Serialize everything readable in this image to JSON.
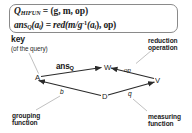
{
  "formula": {
    "line1": {
      "lhs_main": "Q",
      "lhs_sub": "HIFUN",
      "eq": "=",
      "rhs": "(g, m, op)"
    },
    "line2": {
      "fn": "ans",
      "fn_sub": "Q",
      "arg": "(a",
      "arg_sub": "i",
      "arg_close": ")",
      "eq": "=",
      "rhs_head": "red(m/g",
      "rhs_exp": "-1",
      "rhs_tail": "(a",
      "rhs_tail_sub": "i",
      "rhs_end": "), op)"
    },
    "full_text_line1": "Q_HIFUN = (g, m, op)",
    "full_text_line2": "ans_Q(a_i) = red(m/g^-1(a_i), op)"
  },
  "annotations": {
    "key": {
      "title": "key",
      "subtitle": "(of the query)"
    },
    "reduction": {
      "line1": "reduction",
      "line2": "operation"
    },
    "grouping": {
      "line1": "grouping",
      "line2": "function"
    },
    "measuring": {
      "line1": "measuring",
      "line2": "function"
    }
  },
  "diagram": {
    "nodes": [
      {
        "id": "A",
        "label": "A"
      },
      {
        "id": "W",
        "label": "W"
      },
      {
        "id": "V",
        "label": "V"
      },
      {
        "id": "D",
        "label": "D"
      }
    ],
    "edges": [
      {
        "id": "A-W",
        "from": "A",
        "to": "W",
        "label": "ans",
        "label_sub": "Q"
      },
      {
        "id": "V-W",
        "from": "V",
        "to": "W",
        "label": "op"
      },
      {
        "id": "D-V",
        "from": "D",
        "to": "V",
        "label": "q"
      },
      {
        "id": "D-A",
        "from": "D",
        "to": "A",
        "label": "b"
      }
    ]
  },
  "colors": {
    "line": "#2b2b2b",
    "leader": "#9a9a9a",
    "box_border": "#8a8a8a",
    "text": "#1b1b1b",
    "background": "#ffffff"
  }
}
